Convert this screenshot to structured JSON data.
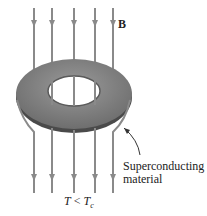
{
  "diagram": {
    "field_label": "B",
    "material_label_line1": "Superconducting",
    "material_label_line2": "material",
    "temperature_T": "T",
    "temperature_relation": " < ",
    "temperature_Tc_main": "T",
    "temperature_Tc_sub": "c",
    "colors": {
      "field_line": "#8a8a8a",
      "ring_top": "#7a7a7a",
      "ring_edge": "#4a4a4a",
      "background": "#ffffff"
    },
    "field_lines_x": [
      34,
      52,
      74,
      95,
      113
    ]
  }
}
